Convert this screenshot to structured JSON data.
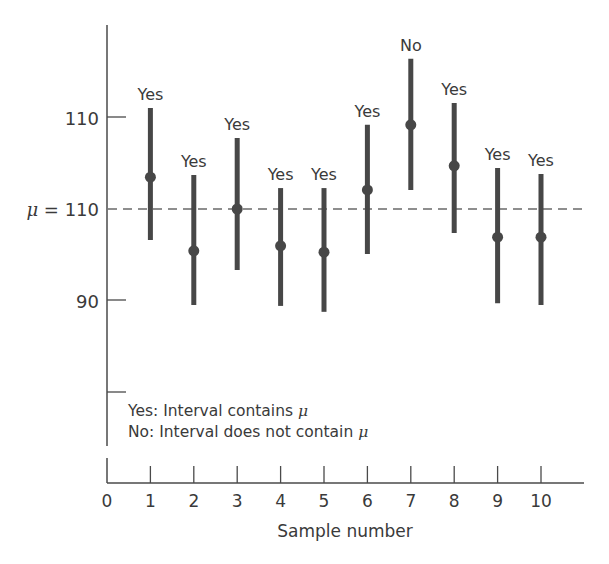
{
  "chart_data": {
    "type": "interval",
    "title": "",
    "xlabel": "Sample number",
    "ylabel": "",
    "x_ticks": [
      "0",
      "1",
      "2",
      "3",
      "4",
      "5",
      "6",
      "7",
      "8",
      "9",
      "10"
    ],
    "y_ticks": [
      {
        "value": 130,
        "label": "110"
      },
      {
        "value": 110,
        "label": "μ = 110"
      },
      {
        "value": 90,
        "label": "90"
      },
      {
        "value": 70,
        "label": ""
      }
    ],
    "reference_line": {
      "value": 110,
      "label": "μ = 110",
      "style": "dashed"
    },
    "ylim": [
      58,
      148
    ],
    "xlim": [
      0,
      11
    ],
    "grid": false,
    "series": [
      {
        "name": "Confidence intervals",
        "x": [
          1,
          2,
          3,
          4,
          5,
          6,
          7,
          8,
          9,
          10
        ],
        "center": [
          117.0,
          100.8,
          110.0,
          101.9,
          100.5,
          114.2,
          128.5,
          119.5,
          103.8,
          103.8
        ],
        "lower": [
          103.2,
          88.9,
          96.6,
          88.7,
          87.4,
          100.1,
          114.2,
          104.7,
          89.3,
          88.9
        ],
        "upper": [
          132.2,
          117.5,
          125.6,
          114.6,
          114.6,
          128.5,
          143.0,
          133.3,
          119.0,
          117.7
        ],
        "labels": [
          "Yes",
          "Yes",
          "Yes",
          "Yes",
          "Yes",
          "Yes",
          "No",
          "Yes",
          "Yes",
          "Yes"
        ]
      }
    ],
    "legend": [
      "Yes: Interval contains μ",
      "No: Interval does not contain μ"
    ],
    "annotations": [
      "Yes",
      "No"
    ]
  },
  "labels": {
    "xlabel": "Sample number",
    "ytick_top": "110",
    "ytick_mu_prefix": "μ",
    "ytick_mu_suffix": " = 110",
    "ytick_90": "90",
    "legend_yes": "Yes: Interval contains ",
    "legend_no": "No: Interval does not contain ",
    "mu": "μ"
  },
  "colors": {
    "bar": "#474747",
    "axis": "#4a4a4a",
    "text": "#3a3a3a",
    "dash": "#6a6a6a"
  }
}
